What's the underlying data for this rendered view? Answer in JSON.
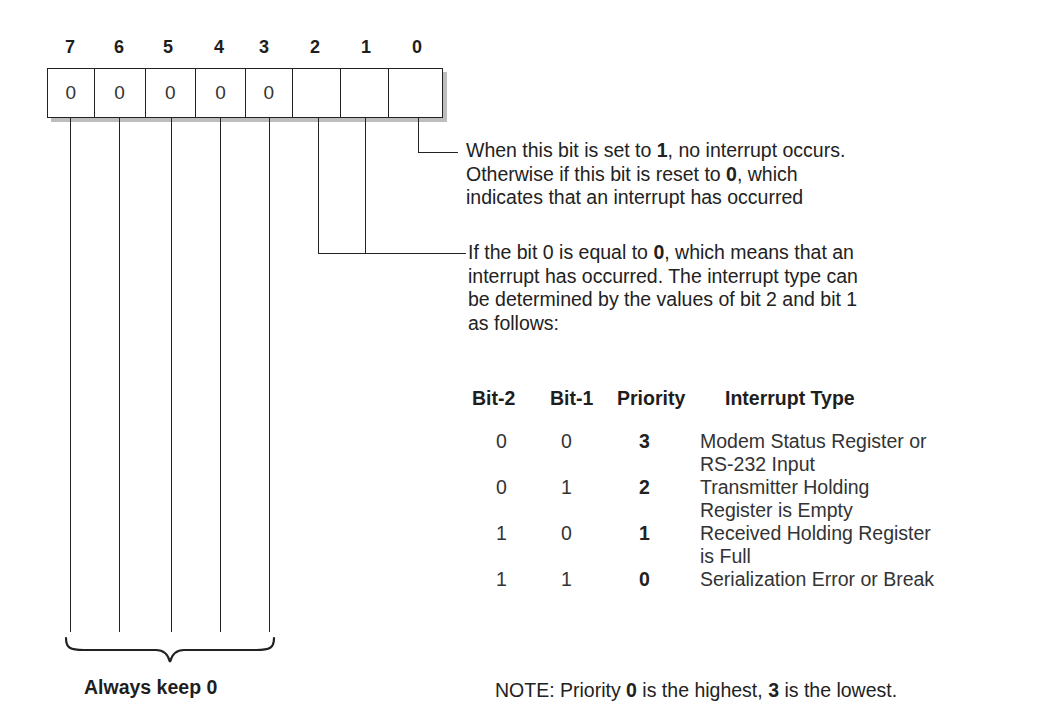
{
  "register": {
    "bit_labels": [
      "7",
      "6",
      "5",
      "4",
      "3",
      "2",
      "1",
      "0"
    ],
    "cell_values": [
      "0",
      "0",
      "0",
      "0",
      "0",
      "",
      "",
      ""
    ]
  },
  "bit0_description": {
    "lines": [
      [
        "When this bit is set to ",
        "1",
        ", no interrupt occurs."
      ],
      [
        "Otherwise if this bit is reset to ",
        "0",
        ", which"
      ],
      [
        "indicates that an interrupt has occurred",
        "",
        ""
      ]
    ]
  },
  "bit21_description": {
    "lines": [
      [
        "If the bit 0 is equal to ",
        "0",
        ", which means that an"
      ],
      [
        "interrupt has occurred. The interrupt type can",
        "",
        ""
      ],
      [
        "be determined by the values of bit 2 and bit 1",
        "",
        ""
      ],
      [
        "as follows:",
        "",
        ""
      ]
    ]
  },
  "table": {
    "headers": [
      "Bit-2",
      "Bit-1",
      "Priority",
      "Interrupt Type"
    ],
    "rows": [
      {
        "bit2": "0",
        "bit1": "0",
        "priority": "3",
        "type_line1": "Modem Status Register or",
        "type_line2": "RS-232 Input"
      },
      {
        "bit2": "0",
        "bit1": "1",
        "priority": "2",
        "type_line1": "Transmitter Holding",
        "type_line2": "Register is Empty"
      },
      {
        "bit2": "1",
        "bit1": "0",
        "priority": "1",
        "type_line1": "Received Holding Register",
        "type_line2": "is Full"
      },
      {
        "bit2": "1",
        "bit1": "1",
        "priority": "0",
        "type_line1": "Serialization Error or Break",
        "type_line2": ""
      }
    ]
  },
  "brace_label": "Always keep 0",
  "note": {
    "prefix": "NOTE: Priority ",
    "highest": "0",
    "middle": " is the highest, ",
    "lowest": "3",
    "suffix": " is the lowest."
  }
}
